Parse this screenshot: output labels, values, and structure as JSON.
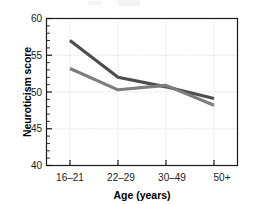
{
  "figure": {
    "background_color": "#ffffff",
    "frame_color": "#1a1a1a",
    "gridline_color": "#c8c8c8"
  },
  "axes": {
    "y_title": "Neuroticism score",
    "x_title": "Age (years)",
    "y_ticks": [
      "40",
      "45",
      "50",
      "55",
      "60"
    ],
    "x_ticks": [
      "16–21",
      "22–29",
      "30–49",
      "50+"
    ]
  },
  "chart_data": {
    "type": "line",
    "title": "",
    "subtitle": "",
    "xlabel": "Age (years)",
    "ylabel": "Neuroticism score",
    "categories": [
      "16–21",
      "22–29",
      "30–49",
      "50+"
    ],
    "ylim": [
      40,
      60
    ],
    "y_major_ticks": [
      40,
      45,
      50,
      55,
      60
    ],
    "y_minor_tick_step": 1,
    "grid": "dotted light-gray horizontal and vertical gridlines at major ticks",
    "legend": "none",
    "series": [
      {
        "name": "Series 1",
        "color": "#4d4d4d",
        "values": [
          57.0,
          52.0,
          50.7,
          49.1
        ]
      },
      {
        "name": "Series 2",
        "color": "#7d7d7d",
        "values": [
          53.2,
          50.3,
          50.9,
          48.2
        ]
      }
    ],
    "annotations": [
      "Series 1 declines steeply from 16–21 to 22–29, then flattens.",
      "Series 2 starts lower and declines gradually; the two series cross near the 30–49 age group."
    ]
  }
}
